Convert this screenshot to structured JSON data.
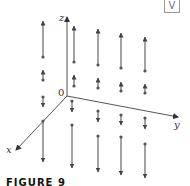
{
  "figure": {
    "caption": "FIGURE 9",
    "corner_badge": "V",
    "axes": {
      "z_label": "z",
      "x_label": "x",
      "y_label": "y",
      "origin_label": "0"
    },
    "colors": {
      "axis": "#555555",
      "vector": "#666666",
      "arrowhead": "#444444",
      "dot": "#555555"
    },
    "vectors": [
      {
        "col": 1,
        "region": "upper-long",
        "x": 43,
        "tail_y": 57,
        "head_y": 21
      },
      {
        "col": 1,
        "region": "upper-short",
        "x": 43,
        "tail_y": 80,
        "head_y": 70
      },
      {
        "col": 1,
        "region": "lower-short",
        "x": 43,
        "tail_y": 97,
        "head_y": 107
      },
      {
        "col": 1,
        "region": "lower-long",
        "x": 43,
        "tail_y": 121,
        "head_y": 162
      },
      {
        "col": 2,
        "region": "upper-long",
        "x": 74,
        "tail_y": 62,
        "head_y": 26
      },
      {
        "col": 2,
        "region": "upper-short",
        "x": 74,
        "tail_y": 86,
        "head_y": 75
      },
      {
        "col": 2,
        "region": "lower-short",
        "x": 72,
        "tail_y": 101,
        "head_y": 112
      },
      {
        "col": 2,
        "region": "lower-long",
        "x": 72,
        "tail_y": 125,
        "head_y": 168
      },
      {
        "col": 3,
        "region": "upper-long",
        "x": 98,
        "tail_y": 65,
        "head_y": 29
      },
      {
        "col": 3,
        "region": "upper-short",
        "x": 98,
        "tail_y": 88,
        "head_y": 78
      },
      {
        "col": 3,
        "region": "lower-short",
        "x": 98,
        "tail_y": 111,
        "head_y": 122
      },
      {
        "col": 3,
        "region": "lower-long",
        "x": 98,
        "tail_y": 136,
        "head_y": 172
      },
      {
        "col": 4,
        "region": "upper-long",
        "x": 121,
        "tail_y": 68,
        "head_y": 33
      },
      {
        "col": 4,
        "region": "upper-short",
        "x": 121,
        "tail_y": 91,
        "head_y": 82
      },
      {
        "col": 4,
        "region": "lower-short",
        "x": 121,
        "tail_y": 115,
        "head_y": 125
      },
      {
        "col": 4,
        "region": "lower-long",
        "x": 121,
        "tail_y": 137,
        "head_y": 175
      },
      {
        "col": 5,
        "region": "upper-long",
        "x": 145,
        "tail_y": 71,
        "head_y": 37
      },
      {
        "col": 5,
        "region": "upper-short",
        "x": 145,
        "tail_y": 93,
        "head_y": 84
      },
      {
        "col": 5,
        "region": "lower-short",
        "x": 145,
        "tail_y": 118,
        "head_y": 129
      },
      {
        "col": 5,
        "region": "lower-long",
        "x": 145,
        "tail_y": 144,
        "head_y": 178
      }
    ]
  }
}
